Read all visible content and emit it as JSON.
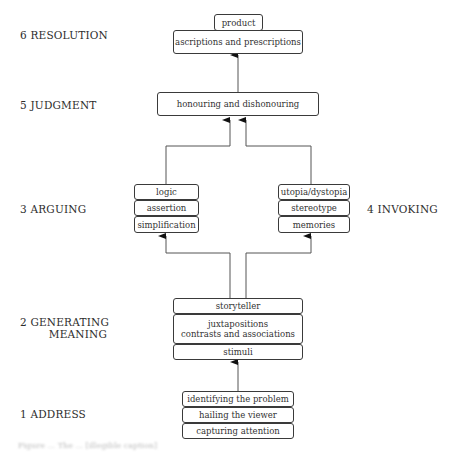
{
  "stages": {
    "resolution": "6 RESOLUTION",
    "judgment": "5  JUDGMENT",
    "arguing": "3  ARGUING",
    "invoking": "4  INVOKING",
    "generating_line1": "2  GENERATING",
    "generating_line2": "MEANING",
    "address": "1  ADDRESS"
  },
  "boxes": {
    "resolution": [
      "product",
      "ascriptions and prescriptions"
    ],
    "judgment": [
      "honouring and dishonouring"
    ],
    "arguing": [
      "logic",
      "assertion",
      "simplification"
    ],
    "invoking": [
      "utopia/dystopia",
      "stereotype",
      "memories"
    ],
    "generating": [
      "storyteller",
      "juxtapositions",
      "contrasts and associations",
      "stimuli"
    ],
    "address": [
      "identifying the problem",
      "hailing the viewer",
      "capturing attention"
    ]
  },
  "caption": "Figure ... The ... [illegible caption]",
  "colors": {
    "line": "#555555",
    "border": "#3a3a3a",
    "text": "#2d2d2d"
  }
}
